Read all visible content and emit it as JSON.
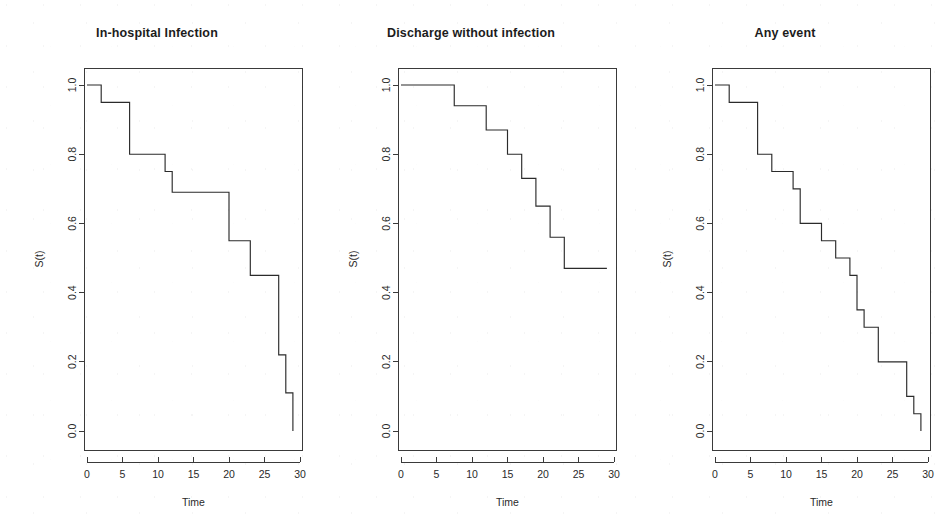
{
  "figure": {
    "background_color": "#ffffff",
    "line_color": "#2b2b2b",
    "axis_color": "#3a3a3a",
    "panel_count": 3
  },
  "panels": [
    {
      "title": "In-hospital Infection",
      "xlabel": "Time",
      "ylabel": "S(t)"
    },
    {
      "title": "Discharge without infection",
      "xlabel": "Time",
      "ylabel": "S(t)"
    },
    {
      "title": "Any event",
      "xlabel": "Time",
      "ylabel": "S(t)"
    }
  ],
  "axes": {
    "x_ticks": [
      "0",
      "5",
      "10",
      "15",
      "20",
      "25",
      "30"
    ],
    "y_ticks": [
      "0.0",
      "0.2",
      "0.4",
      "0.6",
      "0.8",
      "1.0"
    ],
    "xlim": [
      0,
      30
    ],
    "ylim": [
      0.0,
      1.0
    ]
  },
  "chart_data": [
    {
      "type": "line",
      "title": "In-hospital Infection",
      "xlabel": "Time",
      "ylabel": "S(t)",
      "xlim": [
        0,
        30
      ],
      "ylim": [
        0.0,
        1.0
      ],
      "grid": false,
      "legend": "none",
      "step": "post",
      "x": [
        0,
        2,
        6,
        11,
        12,
        20,
        23,
        27,
        28,
        29
      ],
      "y": [
        1.0,
        0.95,
        0.8,
        0.75,
        0.69,
        0.55,
        0.45,
        0.22,
        0.11,
        0.0
      ]
    },
    {
      "type": "line",
      "title": "Discharge without infection",
      "xlabel": "Time",
      "ylabel": "S(t)",
      "xlim": [
        0,
        30
      ],
      "ylim": [
        0.0,
        1.0
      ],
      "grid": false,
      "legend": "none",
      "step": "post",
      "x": [
        0,
        7.5,
        12,
        15,
        17,
        19,
        21,
        23,
        29
      ],
      "y": [
        1.0,
        0.94,
        0.87,
        0.8,
        0.73,
        0.65,
        0.56,
        0.47,
        0.47
      ]
    },
    {
      "type": "line",
      "title": "Any event",
      "xlabel": "Time",
      "ylabel": "S(t)",
      "xlim": [
        0,
        30
      ],
      "ylim": [
        0.0,
        1.0
      ],
      "grid": false,
      "legend": "none",
      "step": "post",
      "x": [
        0,
        2,
        6,
        8,
        11,
        12,
        15,
        17,
        19,
        20,
        21,
        23,
        27,
        28,
        29
      ],
      "y": [
        1.0,
        0.95,
        0.8,
        0.75,
        0.7,
        0.6,
        0.55,
        0.5,
        0.45,
        0.35,
        0.3,
        0.2,
        0.1,
        0.05,
        0.0
      ]
    }
  ]
}
